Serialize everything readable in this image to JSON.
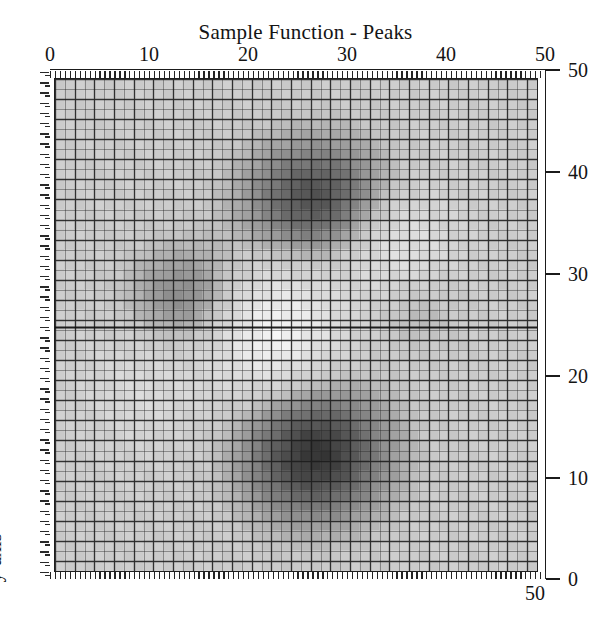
{
  "figure": {
    "width": 611,
    "height": 635,
    "background": "#ffffff",
    "ink_color": "#141414"
  },
  "title": "Sample Function - Peaks",
  "y_axis_label": "y-axis",
  "corner_label": "50",
  "axes": {
    "top": {
      "position": "top",
      "ticks": [
        "0",
        "10",
        "20",
        "30",
        "40",
        "50"
      ],
      "range": [
        0,
        50
      ]
    },
    "right": {
      "position": "right",
      "ticks": [
        "50",
        "40",
        "30",
        "20",
        "10",
        "0"
      ],
      "range": [
        0,
        50
      ]
    }
  },
  "chart_data": {
    "type": "heatmap",
    "title": "Sample Function - Peaks",
    "xlabel": "",
    "ylabel": "y-axis",
    "xlim": [
      0,
      50
    ],
    "ylim": [
      0,
      50
    ],
    "xticks": [
      0,
      10,
      20,
      30,
      40,
      50
    ],
    "yticks": [
      0,
      10,
      20,
      30,
      40,
      50
    ],
    "grid": true,
    "grid_resolution": 49,
    "colormap": "gray-inverted",
    "legend": "none",
    "value_range": [
      -6.5,
      8.1
    ],
    "surface_function": "peaks",
    "peaks": [
      {
        "name": "primary-max-lower",
        "x": 27,
        "y": 12,
        "value": 8.1,
        "shade": "darkest"
      },
      {
        "name": "secondary-max-upper",
        "x": 27,
        "y": 38,
        "value": 6.4,
        "shade": "dark"
      },
      {
        "name": "tertiary-max-left",
        "x": 14,
        "y": 28,
        "value": 3.6,
        "shade": "medium"
      },
      {
        "name": "minor-bump-right",
        "x": 37,
        "y": 27,
        "value": 1.6,
        "shade": "light-medium"
      },
      {
        "name": "saddle-min-center",
        "x": 22,
        "y": 24,
        "value": -6.5,
        "shade": "lightest"
      },
      {
        "name": "min-upper-right",
        "x": 35,
        "y": 33,
        "value": -4.2,
        "shade": "very-light"
      }
    ],
    "z_peak_centers_normalized": [
      {
        "cx": 0.54,
        "cy": 0.76,
        "amp": 1.0,
        "sx": 0.105,
        "sy": 0.095
      },
      {
        "cx": 0.545,
        "cy": 0.245,
        "amp": 0.82,
        "sx": 0.105,
        "sy": 0.085
      },
      {
        "cx": 0.275,
        "cy": 0.445,
        "amp": 0.47,
        "sx": 0.085,
        "sy": 0.075
      },
      {
        "cx": 0.745,
        "cy": 0.465,
        "amp": 0.22,
        "sx": 0.065,
        "sy": 0.06
      },
      {
        "cx": 0.45,
        "cy": 0.515,
        "amp": -0.62,
        "sx": 0.095,
        "sy": 0.1
      },
      {
        "cx": 0.7,
        "cy": 0.335,
        "amp": -0.42,
        "sx": 0.085,
        "sy": 0.085
      },
      {
        "cx": 0.185,
        "cy": 0.62,
        "amp": -0.2,
        "sx": 0.09,
        "sy": 0.09
      }
    ]
  },
  "style": {
    "base_fill": "#c6c6c6",
    "dark_fill": "#3c3c3c",
    "light_fill": "#efefef",
    "mesh_line": "#2a2a2a",
    "axis_line": "#1b1b1b"
  }
}
